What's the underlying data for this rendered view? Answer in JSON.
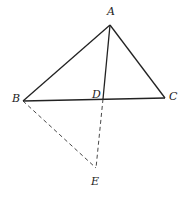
{
  "diagram": {
    "points": {
      "A": {
        "label": "A",
        "x": 110,
        "y": 25,
        "lx": 107,
        "ly": 15
      },
      "B": {
        "label": "B",
        "x": 23,
        "y": 101,
        "lx": 12,
        "ly": 102
      },
      "C": {
        "label": "C",
        "x": 165,
        "y": 98,
        "lx": 169,
        "ly": 100
      },
      "D": {
        "label": "D",
        "x": 103,
        "y": 99,
        "lx": 92,
        "ly": 98
      },
      "E": {
        "label": "E",
        "x": 96,
        "y": 168,
        "lx": 91,
        "ly": 185
      }
    },
    "solid_segments": [
      "AB",
      "AC",
      "BC",
      "AD"
    ],
    "dashed_segments": [
      "BE",
      "DE"
    ],
    "line_color": "#222222"
  }
}
